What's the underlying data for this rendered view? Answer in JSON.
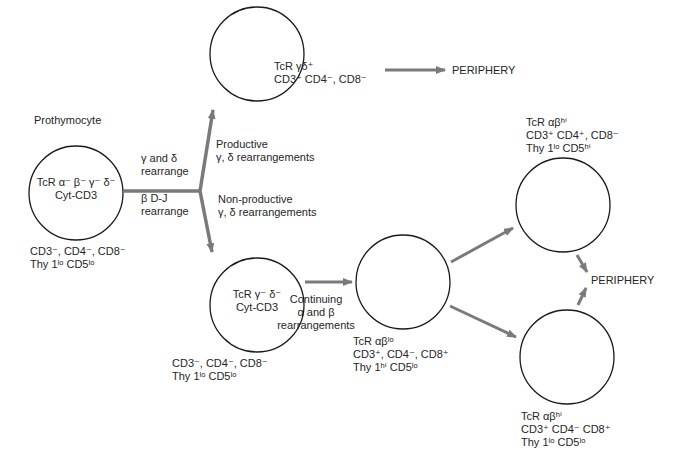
{
  "diagram": {
    "nodes": [
      {
        "id": "prothymocyte",
        "heading": "Prothymocyte",
        "inner": [
          "TcR α⁻ β⁻ γ⁻ δ⁻",
          "Cyt-CD3"
        ],
        "below": [
          "CD3⁻, CD4⁻, CD8⁻",
          "Thy 1ˡᵒ CD5ˡᵒ"
        ]
      },
      {
        "id": "gamma-delta-cell",
        "side": [
          "TcR γδ⁺",
          "CD3⁺ CD4⁻, CD8⁻"
        ]
      },
      {
        "id": "gamma-delta-negative-cell",
        "inner": [
          "TcR γ⁻ δ⁻",
          "Cyt-CD3"
        ],
        "below": [
          "CD3⁻, CD4⁻, CD8⁻",
          "Thy 1ˡᵒ CD5ˡᵒ"
        ]
      },
      {
        "id": "alpha-beta-lo-cell",
        "below": [
          "TcR αβˡᵒ",
          "CD3⁺, CD4⁻, CD8⁺",
          "Thy 1ʰⁱ CD5ˡᵒ"
        ]
      },
      {
        "id": "cd4-single-positive",
        "above": [
          "TcR  αβʰⁱ",
          "CD3⁺ CD4⁺, CD8⁻",
          "Thy 1ˡᵒ CD5ʰⁱ"
        ]
      },
      {
        "id": "cd8-single-positive",
        "below": [
          "TcR αβʰⁱ",
          "CD3⁺ CD4⁻ CD8⁺",
          "Thy 1ˡᵒ CD5ˡᵒ"
        ]
      }
    ],
    "edge_labels": {
      "gamma_delta_rearrange": [
        "γ and δ",
        "rearrange"
      ],
      "beta_dj_rearrange": [
        "β D-J",
        "rearrange"
      ],
      "productive": [
        "Productive",
        "γ, δ rearrangements"
      ],
      "non_productive": [
        "Non-productive",
        "γ, δ rearrangements"
      ],
      "continuing": [
        "Continuing",
        "α and β",
        "rearrangements"
      ]
    },
    "destinations": {
      "periphery_top": "PERIPHERY",
      "periphery_right": "PERIPHERY"
    },
    "colors": {
      "arrow": "#7a7a7a",
      "circle_stroke": "#1a1a1a",
      "text": "#262626",
      "background": "#ffffff"
    }
  }
}
